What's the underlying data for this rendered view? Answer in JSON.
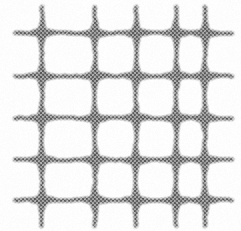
{
  "figure": {
    "title": "Woven wire mesh grid",
    "description": "Scanned grayscale micrograph-style image of a square woven mesh: five vertical strands crossing five horizontal strands, producing star-shaped thickened intersection nodes on a white background.",
    "texture": "dithered-halftone",
    "background_color": "#ffffff",
    "ink_color": "#6b6b6b",
    "node_color": "#4a4a4a",
    "canvas": {
      "width": 241,
      "height": 231
    }
  },
  "grid": {
    "columns": 5,
    "rows": 5,
    "column_centers_px": [
      42,
      95,
      136,
      176,
      205
    ],
    "row_centers_px": [
      33,
      76,
      118,
      160,
      200
    ],
    "strand_thickness_px": 7,
    "node_radius_px": 15,
    "node_spike_length_px": 14,
    "vertical_extent_px": [
      6,
      226
    ],
    "horizontal_extent_px": [
      14,
      232
    ],
    "irregularity": 0.35
  },
  "rendering": {
    "dither_cell_px": 2,
    "dither_density": 0.62,
    "blur_px": 1.1,
    "min_gray": 56,
    "max_gray": 255
  }
}
